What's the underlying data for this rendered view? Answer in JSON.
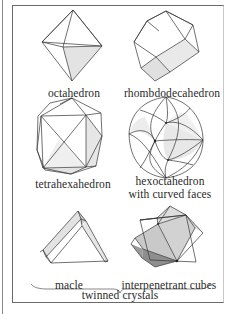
{
  "figure": {
    "colors": {
      "line": "#333333",
      "shade_light": "#e6e6e6",
      "shade_mid": "#cfcfcf",
      "shade_dark": "#8c8c8c",
      "frame": "#6a6a6a"
    },
    "items": [
      {
        "id": "octahedron",
        "label": "octahedron"
      },
      {
        "id": "rhombdodecahedron",
        "label": "rhombdodecahedron"
      },
      {
        "id": "tetrahexahedron",
        "label": "tetrahexahedron"
      },
      {
        "id": "hexoctahedron",
        "label": "hexoctahedron",
        "label_line2": "with curved faces"
      },
      {
        "id": "macle",
        "label": "macle"
      },
      {
        "id": "interpenetrant-cubes",
        "label": "interpenetrant cubes"
      }
    ],
    "group_label": "twinned crystals"
  }
}
